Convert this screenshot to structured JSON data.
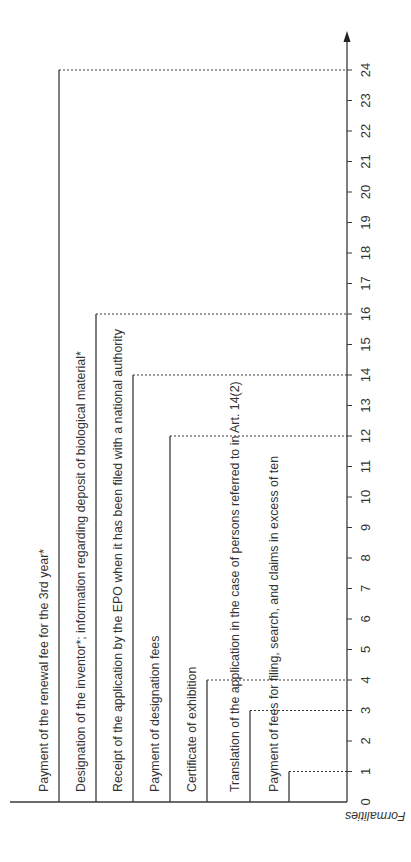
{
  "diagram": {
    "title": "Formalities",
    "orientation": "rotated-90-ccw",
    "axis": {
      "label": "Formalities",
      "min": 0,
      "max": 24,
      "ticks": [
        0,
        1,
        2,
        3,
        4,
        5,
        6,
        7,
        8,
        9,
        10,
        11,
        12,
        13,
        14,
        15,
        16,
        17,
        18,
        19,
        20,
        21,
        22,
        23,
        24
      ],
      "unit_hint": "months"
    },
    "items": [
      {
        "label": "Payment of the renewal fee for the 3rd year*",
        "value": 24
      },
      {
        "label": "Designation of the inventor*; information regarding deposit of biological material*",
        "value": 16
      },
      {
        "label": "Receipt of the application by the EPO when it has been filed with a national authority",
        "value": 14
      },
      {
        "label": "Payment of designation fees",
        "value": 12
      },
      {
        "label": "Certificate of exhibition",
        "value": 4
      },
      {
        "label": "Translation of the application in the case of persons referred to in Art. 14(2)",
        "value": 3
      },
      {
        "label": "Payment of fees for filing, search, and claims in excess of ten",
        "value": 1
      }
    ],
    "colors": {
      "line": "#3a3a3a",
      "text": "#333333",
      "background": "#ffffff"
    }
  }
}
